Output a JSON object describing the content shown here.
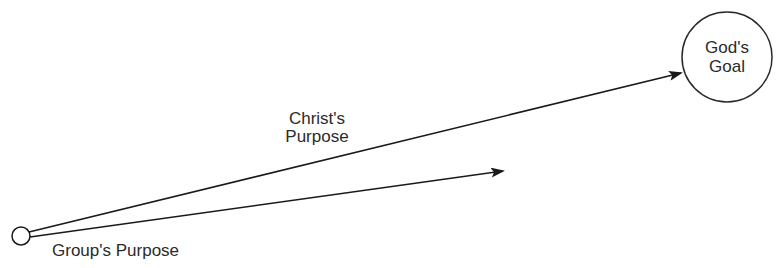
{
  "diagram": {
    "origin_node": {
      "label": ""
    },
    "goal_node": {
      "line1": "God's",
      "line2": "Goal"
    },
    "upper_arrow": {
      "line1": "Christ's",
      "line2": "Purpose"
    },
    "lower_arrow": {
      "label": "Group's Purpose"
    },
    "colors": {
      "stroke": "#1a1a1a",
      "text": "#2b2b2b",
      "background": "#ffffff"
    }
  }
}
